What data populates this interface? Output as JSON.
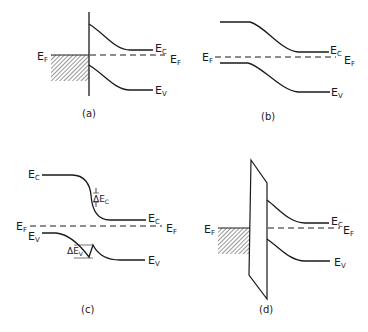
{
  "figure": {
    "panels": [
      {
        "id": "a",
        "caption": "(a)",
        "labels": {
          "ec": "E",
          "ec_sub": "C",
          "ef_left": "E",
          "ef_left_sub": "F",
          "ef_right": "E",
          "ef_right_sub": "F",
          "ev": "E",
          "ev_sub": "V"
        }
      },
      {
        "id": "b",
        "caption": "(b)",
        "labels": {
          "ec": "E",
          "ec_sub": "C",
          "ef_left": "E",
          "ef_left_sub": "F",
          "ef_right": "E",
          "ef_right_sub": "F",
          "ev": "E",
          "ev_sub": "V"
        }
      },
      {
        "id": "c",
        "caption": "(c)",
        "labels": {
          "ec_left": "E",
          "ec_left_sub": "C",
          "ec_right": "E",
          "ec_right_sub": "C",
          "ef_left": "E",
          "ef_left_sub": "F",
          "ef_right": "E",
          "ef_right_sub": "F",
          "ev_left": "E",
          "ev_left_sub": "V",
          "ev_right": "E",
          "ev_right_sub": "V",
          "delta_ec": "ΔE",
          "delta_ec_sub": "C",
          "delta_ev": "ΔE",
          "delta_ev_sub": "V"
        }
      },
      {
        "id": "d",
        "caption": "(d)",
        "labels": {
          "ec": "E",
          "ec_sub": "C",
          "ef_left": "E",
          "ef_left_sub": "F",
          "ef_right": "E",
          "ef_right_sub": "F",
          "ev": "E",
          "ev_sub": "V"
        }
      }
    ]
  }
}
